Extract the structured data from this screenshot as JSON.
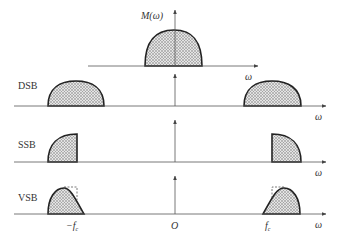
{
  "figure": {
    "panels": [
      {
        "id": "baseband",
        "label": "",
        "y_label": "M(ω)",
        "x_label": "ω"
      },
      {
        "id": "dsb",
        "label": "DSB",
        "x_label": "ω"
      },
      {
        "id": "ssb",
        "label": "SSB",
        "x_label": "ω"
      },
      {
        "id": "vsb",
        "label": "VSB",
        "x_label": "ω"
      }
    ],
    "tick_labels": {
      "neg_fc": "−f",
      "neg_fc_sub": "c",
      "origin": "O",
      "pos_fc": "f",
      "pos_fc_sub": "c"
    },
    "colors": {
      "line": "#222222",
      "axis": "#555555",
      "hatch": "#777777"
    }
  }
}
